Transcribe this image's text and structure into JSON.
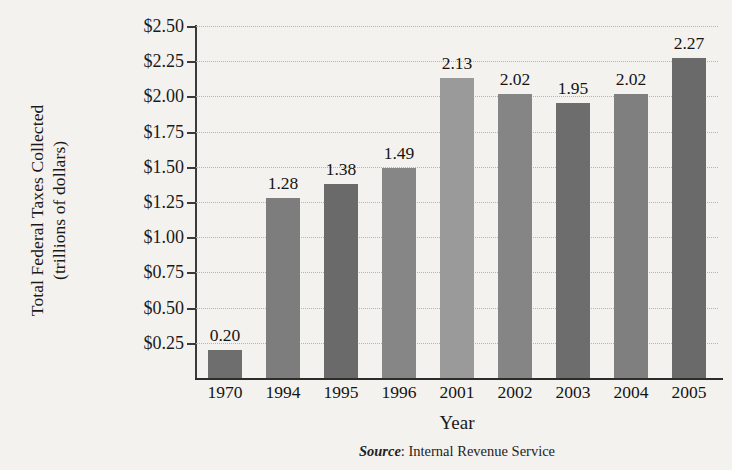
{
  "chart_data": {
    "type": "bar",
    "title": "",
    "xlabel": "Year",
    "ylabel": "Total Federal Taxes Collected (trillions of dollars)",
    "ylabel_line1": "Total Federal Taxes Collected",
    "ylabel_line2": "(trillions of dollars)",
    "categories": [
      "1970",
      "1994",
      "1995",
      "1996",
      "2001",
      "2002",
      "2003",
      "2004",
      "2005"
    ],
    "values": [
      0.2,
      1.28,
      1.38,
      1.49,
      2.13,
      2.02,
      1.95,
      2.02,
      2.27
    ],
    "value_labels": [
      "0.20",
      "1.28",
      "1.38",
      "1.49",
      "2.13",
      "2.02",
      "1.95",
      "2.02",
      "2.27"
    ],
    "bar_colors": [
      "#6e6e6e",
      "#7d7d7d",
      "#6a6a6a",
      "#868686",
      "#9a9a9a",
      "#858585",
      "#6d6d6d",
      "#7f7f7f",
      "#6a6a6a"
    ],
    "ylim": [
      0,
      2.5
    ],
    "ytick_values": [
      0.25,
      0.5,
      0.75,
      1.0,
      1.25,
      1.5,
      1.75,
      2.0,
      2.25,
      2.5
    ],
    "ytick_labels": [
      "$0.25",
      "$0.50",
      "$0.75",
      "$1.00",
      "$1.25",
      "$1.50",
      "$1.75",
      "$2.00",
      "$2.25",
      "$2.50"
    ],
    "grid": true,
    "legend": "none",
    "bar_unit_note": "values plotted as fraction of axis; 0.20 bar drawn slightly below its label"
  },
  "source": {
    "label": "Source",
    "separator": ": ",
    "text": "Internal Revenue Service",
    "full": "Source: Internal Revenue Service"
  },
  "colors": {
    "background": "#f4f2ee",
    "axis": "#2d2d2d",
    "gridline": "#b8b4ad",
    "text": "#141414"
  }
}
